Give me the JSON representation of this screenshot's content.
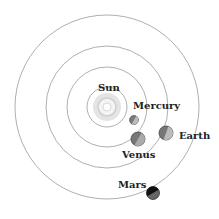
{
  "diagram": {
    "labels": {
      "sun": "Sun",
      "mercury": "Mercury",
      "venus": "Venus",
      "earth": "Earth",
      "mars": "Mars"
    },
    "colors": {
      "orbit": "#999999",
      "planet": "#777777",
      "sun": "#dddddd",
      "text": "#222222"
    }
  }
}
